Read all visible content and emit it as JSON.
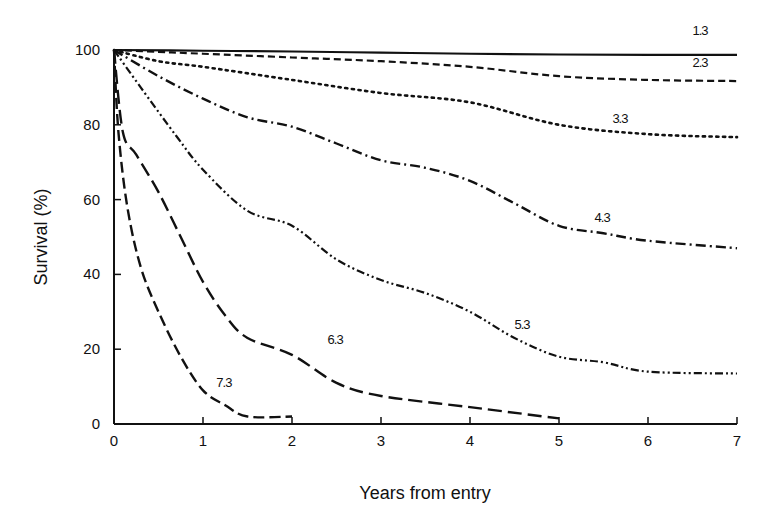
{
  "chart_data": {
    "type": "line",
    "title": "",
    "xlabel": "Years from entry",
    "ylabel": "Survival (%)",
    "xlim": [
      0,
      7
    ],
    "ylim": [
      0,
      100
    ],
    "xticks": [
      0,
      1,
      2,
      3,
      4,
      5,
      6,
      7
    ],
    "yticks": [
      0,
      20,
      40,
      60,
      80,
      100
    ],
    "grid": false,
    "legend": "inline labels",
    "series": [
      {
        "name": "1.3",
        "style": "solid",
        "x": [
          0,
          1,
          2,
          3,
          4,
          5,
          6,
          7
        ],
        "y": [
          100,
          99.8,
          99.6,
          99.3,
          99,
          98.8,
          98.7,
          98.7
        ],
        "label_pos": [
          6.5,
          104
        ]
      },
      {
        "name": "2.3",
        "style": "dashed-short",
        "x": [
          0,
          0.5,
          1,
          2,
          3,
          4,
          5,
          6,
          7
        ],
        "y": [
          100,
          99.5,
          99,
          98,
          97,
          95.5,
          93,
          92,
          91.7
        ],
        "label_pos": [
          6.5,
          95.5
        ]
      },
      {
        "name": "3.3",
        "style": "dotted",
        "x": [
          0,
          0.5,
          1,
          2,
          3,
          4,
          5,
          6,
          7
        ],
        "y": [
          100,
          97,
          95.5,
          92,
          88.5,
          86,
          80,
          77.5,
          76.7
        ],
        "label_pos": [
          5.6,
          80.5
        ]
      },
      {
        "name": "4.3",
        "style": "dash-dot",
        "x": [
          0,
          0.5,
          1,
          1.5,
          2,
          2.5,
          3,
          3.5,
          4,
          4.5,
          5,
          5.5,
          6,
          7
        ],
        "y": [
          100,
          93,
          87,
          82,
          79.5,
          75,
          70.5,
          68.5,
          65,
          59,
          53,
          51,
          49,
          47
        ],
        "label_pos": [
          5.4,
          54
        ]
      },
      {
        "name": "5.3",
        "style": "dash-dot-dot",
        "x": [
          0,
          0.3,
          0.7,
          1,
          1.5,
          2,
          2.5,
          3,
          3.5,
          4,
          4.5,
          5,
          5.5,
          6,
          7
        ],
        "y": [
          100,
          90,
          77,
          68,
          57,
          53,
          44,
          38.5,
          35,
          30,
          23,
          18,
          16.5,
          14,
          13.5
        ],
        "label_pos": [
          4.5,
          25.5
        ]
      },
      {
        "name": "6.3",
        "style": "long-dash",
        "x": [
          0,
          0.1,
          0.25,
          0.5,
          0.75,
          1,
          1.25,
          1.5,
          2,
          2.5,
          3,
          4,
          5
        ],
        "y": [
          100,
          78,
          72,
          62,
          50,
          38,
          29,
          23,
          18.5,
          11,
          7.5,
          4.5,
          1.5
        ],
        "label_pos": [
          2.4,
          21.5
        ]
      },
      {
        "name": "7.3",
        "style": "medium-dash",
        "x": [
          0,
          0.05,
          0.15,
          0.3,
          0.5,
          0.75,
          1,
          1.25,
          1.5,
          2
        ],
        "y": [
          100,
          78,
          58,
          42,
          30,
          18,
          9,
          5,
          2,
          2
        ],
        "label_pos": [
          1.15,
          10
        ]
      }
    ]
  }
}
